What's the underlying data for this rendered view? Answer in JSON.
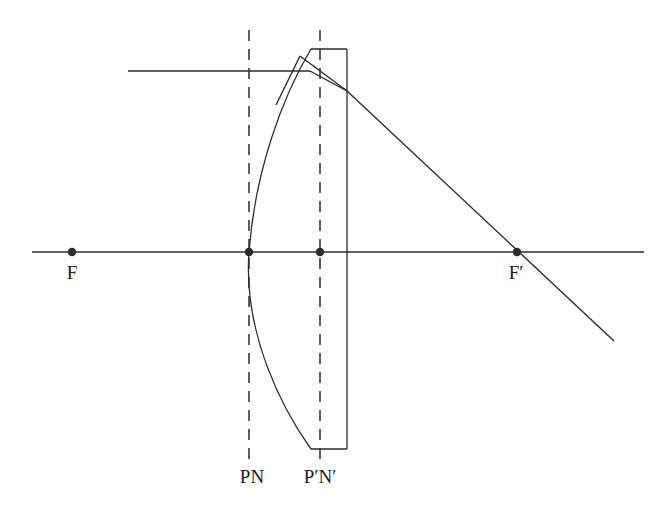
{
  "figure": {
    "background_color": "#ffffff",
    "ink_color": "#2b2b2b"
  },
  "labels": {
    "front_focal_point": "F",
    "rear_focal_point": "F′",
    "front_principal_nodal_plane": "PN",
    "rear_principal_nodal_plane": "P′N′"
  },
  "chart_data": {
    "type": "diagram",
    "xlabel": "",
    "ylabel": "",
    "xlim": [
      0,
      665
    ],
    "ylim": [
      0,
      512
    ],
    "grid": false,
    "legend": "none",
    "stroke_color": "#2b2b2b",
    "stroke_width": 1.4,
    "optical_axis": {
      "name": "optical-axis",
      "x1": 32,
      "y1": 252,
      "x2": 644,
      "y2": 252
    },
    "points": [
      {
        "name": "F",
        "label": "F",
        "x": 72,
        "y": 252,
        "r": 4.2,
        "label_x": 72,
        "label_y": 279
      },
      {
        "name": "P",
        "label": "",
        "x": 249,
        "y": 252,
        "r": 4.2
      },
      {
        "name": "P'",
        "label": "",
        "x": 320,
        "y": 252,
        "r": 4.2
      },
      {
        "name": "F'",
        "label": "F′",
        "x": 517,
        "y": 252,
        "r": 4.2,
        "label_x": 516,
        "label_y": 279
      }
    ],
    "dashed_planes": [
      {
        "name": "PN",
        "label": "PN",
        "x": 249,
        "y_top": 30,
        "y_bottom": 462,
        "label_x": 252,
        "label_y": 483
      },
      {
        "name": "P'N'",
        "label": "P′N′",
        "x": 320,
        "y_top": 30,
        "y_bottom": 466,
        "label_x": 320,
        "label_y": 483
      }
    ],
    "lens_body": {
      "name": "plano-convex-lens",
      "flat_face_x": 347,
      "top_y": 49,
      "bottom_y": 449,
      "top_edge": {
        "x1": 311,
        "y1": 49,
        "x2": 347,
        "y2": 49
      },
      "right_edge": {
        "x1": 347,
        "y1": 49,
        "x2": 347,
        "y2": 449
      },
      "bottom_edge": {
        "x1": 311,
        "y1": 449,
        "x2": 347,
        "y2": 449
      },
      "convex_surface_path": "M 311 49 C 283 96 255 170 249 252 C 243 334 283 410 311 449",
      "convex_vertex_x": 249,
      "convex_vertex_y": 252
    },
    "rays": [
      {
        "name": "incident-parallel-ray",
        "segments": [
          {
            "x1": 128,
            "y1": 71,
            "x2": 310,
            "y2": 71
          }
        ],
        "height_above_axis": 181
      },
      {
        "name": "internal-refracted-ray",
        "segments": [
          {
            "x1": 310,
            "y1": 71,
            "x2": 347,
            "y2": 91
          }
        ]
      },
      {
        "name": "emergent-ray-through-F-prime",
        "segments": [
          {
            "x1": 347,
            "y1": 91,
            "x2": 614,
            "y2": 341
          }
        ]
      },
      {
        "name": "construction-ray-to-principal-plane",
        "segments": [
          {
            "x1": 300,
            "y1": 56,
            "x2": 347,
            "y2": 91
          }
        ]
      },
      {
        "name": "construction-ray-lower-left",
        "segments": [
          {
            "x1": 300,
            "y1": 56,
            "x2": 276,
            "y2": 105
          }
        ]
      }
    ]
  }
}
